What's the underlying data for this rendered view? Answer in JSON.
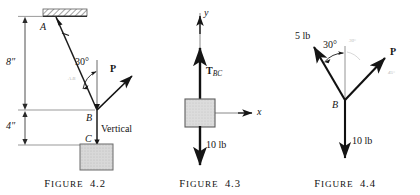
{
  "page": {
    "background_color": "#ffffff",
    "ink_color": "#151515",
    "box_fill_color": "#d6d6d6",
    "box_border_color": "#6b6b6b",
    "hatch_color": "#8a8a8a",
    "faint_color": "#b9b9b9"
  },
  "figures": [
    {
      "id": "figure-4-2",
      "caption_prefix": "F",
      "caption_word": "IGURE",
      "caption_number": "4.2",
      "caption_full": "FIGURE 4.2",
      "labels": {
        "point_a": "A",
        "point_b": "B",
        "point_c": "C",
        "angle": "30°",
        "force_p": "P",
        "vertical": "Vertical",
        "dim_upper": "8″",
        "dim_lower": "4″",
        "smudge": "A.B"
      }
    },
    {
      "id": "figure-4-3",
      "caption_prefix": "F",
      "caption_word": "IGURE",
      "caption_number": "4.3",
      "caption_full": "FIGURE 4.3",
      "labels": {
        "axis_y": "y",
        "axis_x": "x",
        "tension_symbol": "T",
        "tension_subscript": "BC",
        "weight": "10 lb"
      }
    },
    {
      "id": "figure-4-4",
      "caption_prefix": "F",
      "caption_word": "IGURE",
      "caption_number": "4.4",
      "caption_full": "FIGURE 4.4",
      "labels": {
        "force_left": "5 lb",
        "angle": "30°",
        "point_b": "B",
        "force_p": "P",
        "weight": "10 lb",
        "smudge_top": "30°",
        "smudge_right": "45°"
      }
    }
  ]
}
